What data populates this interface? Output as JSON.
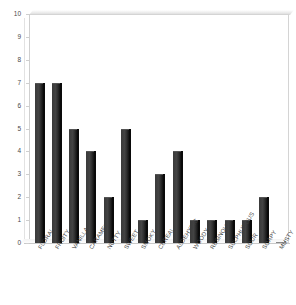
{
  "chart_data": {
    "type": "bar",
    "title": "",
    "subtitle": "",
    "xlabel": "",
    "ylabel": "",
    "ylim": [
      0,
      10
    ],
    "ytick_step": 1,
    "yticks": [
      "0",
      "1",
      "2",
      "3",
      "4",
      "5",
      "6",
      "7",
      "8",
      "9",
      "10"
    ],
    "grid": false,
    "legend": "none",
    "bar_color": "#333333",
    "axis_color": "#cfcfcf",
    "label_color": "#3f3f3f",
    "categories": [
      "FLORAL",
      "FRUITY",
      "VANILLA",
      "CARAMEL",
      "NUTTY",
      "SWEET",
      "SMOKY",
      "CEREAL",
      "ALDEHYDIC",
      "WOODY",
      "RESINOUS",
      "SULPHUROUS",
      "SOUR",
      "SOAPY",
      "MUSTY"
    ],
    "values": [
      7,
      7,
      5,
      4,
      2,
      5,
      1,
      3,
      4,
      1,
      1,
      1,
      1,
      2,
      0
    ]
  }
}
